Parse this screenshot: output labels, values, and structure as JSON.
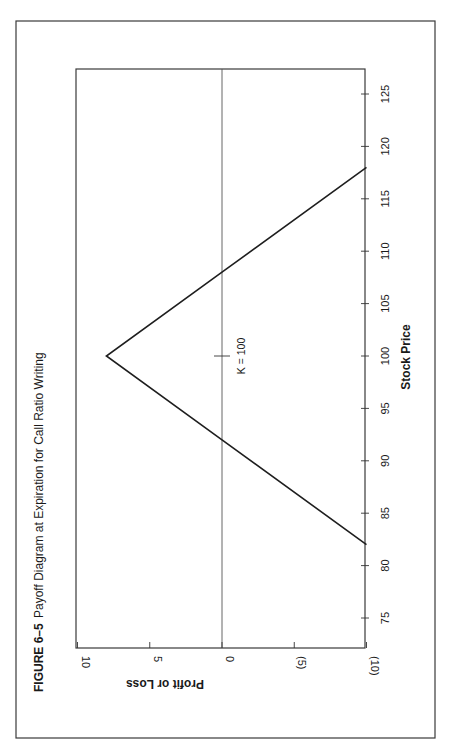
{
  "figure": {
    "number": "FIGURE 6–5",
    "title": "Payoff Diagram at Expiration for Call Ratio Writing"
  },
  "chart_data": {
    "type": "line",
    "title": "FIGURE 6–5 Payoff Diagram at Expiration for Call Ratio Writing",
    "xlabel": "Stock Price",
    "ylabel": "Profit or Loss",
    "orientation": "rotated 90° counter-clockwise (stock price runs bottom-to-top, profit axis runs right-to-left)",
    "xlim": [
      72,
      127
    ],
    "ylim": [
      -10,
      10
    ],
    "x_ticks": [
      75,
      80,
      85,
      90,
      95,
      100,
      105,
      110,
      115,
      120,
      125
    ],
    "x_tick_labels": [
      "75",
      "80",
      "85",
      "90",
      "95",
      "100",
      "105",
      "110",
      "115",
      "120",
      "125"
    ],
    "y_ticks": [
      10,
      5,
      0,
      -5,
      -10
    ],
    "y_tick_labels": [
      "10",
      "5",
      "0",
      "(5)",
      "(10)"
    ],
    "grid": false,
    "series": [
      {
        "name": "Call Ratio Writing Payoff",
        "x": [
          82,
          92,
          100,
          108,
          118
        ],
        "y": [
          -10,
          0,
          8,
          0,
          -10
        ]
      }
    ],
    "annotations": [
      {
        "text": "K = 100",
        "x": 100,
        "y": 0
      }
    ],
    "zero_line": true
  }
}
